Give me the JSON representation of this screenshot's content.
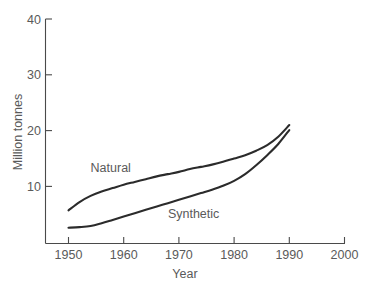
{
  "chart_data": {
    "type": "line",
    "title": "",
    "subtitle": "",
    "xlabel": "Year",
    "ylabel": "Million tonnes",
    "xlim": [
      1945,
      2003
    ],
    "ylim": [
      0,
      40
    ],
    "xticks": [
      1950,
      1960,
      1970,
      1980,
      1990,
      2000
    ],
    "xtick_labels": [
      "1950",
      "1960",
      "1970",
      "1980",
      "1990",
      "2000"
    ],
    "yticks": [
      10,
      20,
      30,
      40
    ],
    "ytick_labels": [
      "10",
      "20",
      "30",
      "40"
    ],
    "grid": false,
    "legend": "inline-annotations",
    "legend_position": "inline",
    "series": [
      {
        "name": "Natural",
        "label": "Natural",
        "color": "#2b2b2b",
        "x": [
          1950,
          1952,
          1954,
          1956,
          1958,
          1960,
          1962,
          1964,
          1966,
          1968,
          1970,
          1972,
          1974,
          1976,
          1978,
          1980,
          1982,
          1984,
          1986,
          1988,
          1990
        ],
        "values": [
          5.7,
          7.2,
          8.3,
          9.1,
          9.7,
          10.3,
          10.8,
          11.3,
          11.8,
          12.2,
          12.6,
          13.1,
          13.5,
          13.9,
          14.4,
          15.0,
          15.6,
          16.4,
          17.4,
          18.9,
          21.0
        ]
      },
      {
        "name": "Synthetic",
        "label": "Synthetic",
        "color": "#2b2b2b",
        "x": [
          1950,
          1952,
          1954,
          1956,
          1958,
          1960,
          1962,
          1964,
          1966,
          1968,
          1970,
          1972,
          1974,
          1976,
          1978,
          1980,
          1982,
          1984,
          1986,
          1988,
          1990
        ],
        "values": [
          2.6,
          2.7,
          2.9,
          3.4,
          4.0,
          4.6,
          5.2,
          5.8,
          6.4,
          7.0,
          7.6,
          8.2,
          8.8,
          9.4,
          10.1,
          11.0,
          12.2,
          13.8,
          15.6,
          17.6,
          20.1
        ]
      }
    ],
    "annotations": [
      {
        "text": "Natural",
        "x": 1954,
        "y": 12.6
      },
      {
        "text": "Synthetic",
        "x": 1968,
        "y": 4.4
      }
    ],
    "colors": {
      "curve": "#2b2b2b",
      "axis": "#4a4a4a",
      "text": "#5a5a5a",
      "background": "#ffffff"
    }
  }
}
